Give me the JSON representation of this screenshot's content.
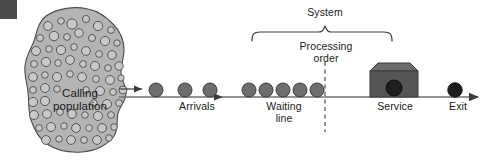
{
  "figure": {
    "kind": "queueing-system-diagram",
    "title_text": "",
    "corner_mark": {
      "name": "corner-block",
      "color": "#4a4a4a"
    },
    "labels": {
      "calling_population": "Calling\npopulation",
      "arrivals": "Arrivals",
      "system": "System",
      "processing_order": "Processing\norder",
      "waiting_line": "Waiting\nline",
      "service": "Service",
      "exit": "Exit"
    },
    "colors": {
      "population_fill": "#b4b4b4",
      "population_stroke": "#4d4d4d",
      "population_dot_fill": "#c8c8c8",
      "population_dot_stroke": "#4d4d4d",
      "entity_fill": "#6e6e6e",
      "entity_stroke": "#3a3a3a",
      "exit_entity_fill": "#1c1c1c",
      "line_color": "#6f6f6f",
      "bracket_color": "#3a3a3a",
      "dashed_color": "#3a3a3a",
      "server_body": "#555555",
      "server_top": "#6b6b6b",
      "server_port": "#1e1e1e",
      "text_color": "#1a1a1a"
    },
    "geometry": {
      "baseline_y": 97,
      "entity_radius": 7,
      "arrival_entities_x": [
        156,
        185,
        210
      ],
      "waiting_entities_x": [
        249,
        266,
        283,
        300,
        317
      ],
      "exit_entity_x": 455,
      "dashed_line_x": 325,
      "bracket_left_x": 252,
      "bracket_right_x": 392,
      "bracket_peak_x": 325,
      "server_center_x": 394
    },
    "counts": {
      "arrival_entities": 3,
      "waiting_entities": 5,
      "exit_entities": 1
    }
  }
}
